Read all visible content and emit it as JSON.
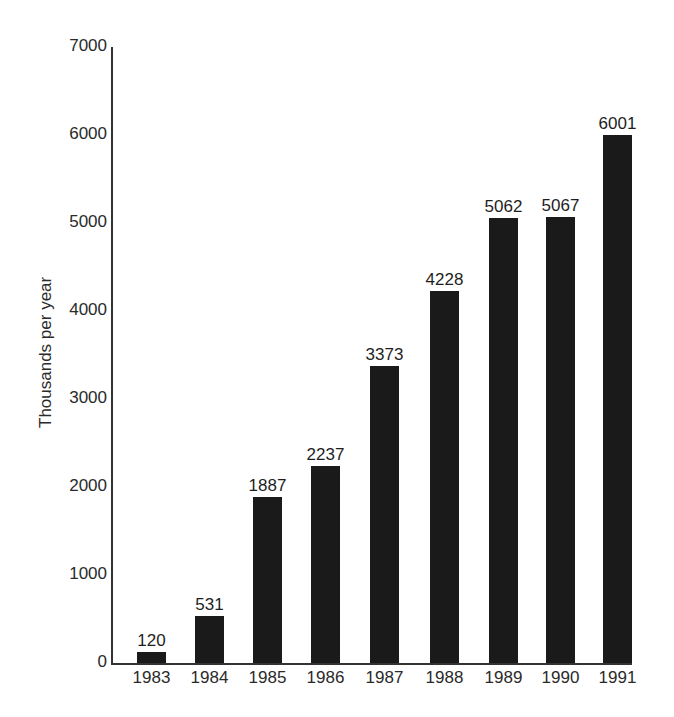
{
  "chart_data": {
    "type": "bar",
    "title": "",
    "xlabel": "",
    "ylabel": "Thousands per year",
    "categories": [
      "1983",
      "1984",
      "1985",
      "1986",
      "1987",
      "1988",
      "1989",
      "1990",
      "1991"
    ],
    "values": [
      120,
      531,
      1887,
      2237,
      3373,
      4228,
      5062,
      5067,
      6001
    ],
    "value_labels": [
      "120",
      "531",
      "1887",
      "2237",
      "3373",
      "4228",
      "5062",
      "5067",
      "6001"
    ],
    "ylim": [
      0,
      7000
    ],
    "yticks": [
      0,
      1000,
      2000,
      3000,
      4000,
      5000,
      6000,
      7000
    ],
    "ytick_labels": [
      "0",
      "1000",
      "2000",
      "3000",
      "4000",
      "5000",
      "6000",
      "7000"
    ],
    "grid": false,
    "legend": null,
    "bar_color": "#1a1a1a"
  }
}
